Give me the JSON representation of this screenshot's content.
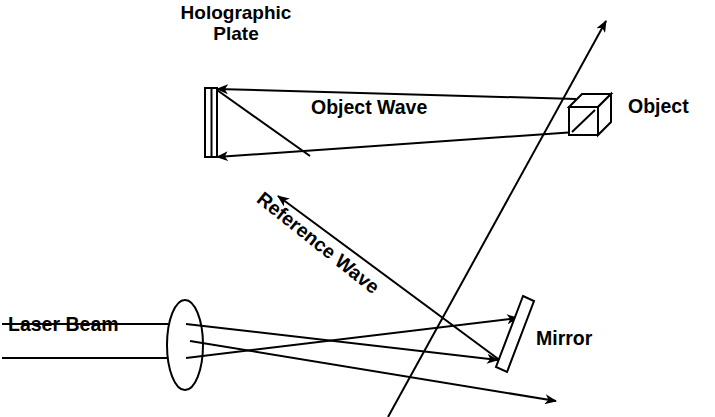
{
  "figure": {
    "background_color": "#ffffff",
    "ink_color": "#000000",
    "width": 715,
    "height": 417
  },
  "labels": {
    "holographic_plate_line1": "Holographic",
    "holographic_plate_line2": "Plate",
    "object_wave": "Object Wave",
    "object": "Object",
    "reference_wave": "Reference Wave",
    "laser_beam": "Laser Beam",
    "mirror": "Mirror"
  },
  "components": {
    "holographic_plate": {
      "name": "holographic-plate",
      "shape": "vertical-slab",
      "x1": 205,
      "y1": 88,
      "x2": 217,
      "y2": 157
    },
    "lens": {
      "name": "lens",
      "shape": "ellipse",
      "cx": 185,
      "cy": 345,
      "rx": 18,
      "ry": 45
    },
    "mirror": {
      "name": "mirror",
      "shape": "tilted-slab",
      "top_x": 528,
      "top_y": 300,
      "bottom_x": 500,
      "bottom_y": 370,
      "thickness": 11
    },
    "object_cube": {
      "name": "object-cube",
      "shape": "wireframe-cube",
      "front_x": 568,
      "front_y": 106,
      "size": 30,
      "depth": 13
    }
  },
  "rays": [
    {
      "name": "object-wave-upper",
      "from": "object",
      "to": "plate",
      "arrow": "left"
    },
    {
      "name": "object-wave-lower",
      "from": "object",
      "to": "plate",
      "arrow": "left"
    },
    {
      "name": "plate-diagonal",
      "from": "plate-top",
      "to": "plate-lower-ray",
      "arrow": "none"
    },
    {
      "name": "reference-wave-to-plate",
      "from": "mirror",
      "to": "plate",
      "arrow": "up-left"
    },
    {
      "name": "laser-upper-input",
      "from": "laser",
      "to": "lens",
      "arrow": "none"
    },
    {
      "name": "laser-lower-input",
      "from": "laser",
      "to": "lens",
      "arrow": "none"
    },
    {
      "name": "lens-to-mirror-upper",
      "from": "lens",
      "to": "mirror-top",
      "arrow": "right"
    },
    {
      "name": "lens-to-mirror-lower",
      "from": "lens",
      "to": "mirror-bottom",
      "arrow": "right"
    },
    {
      "name": "reflected-beam-up-right",
      "from": "plate",
      "to": "upper-right",
      "arrow": "up-right"
    },
    {
      "name": "reflected-beam-down-right",
      "from": "lens",
      "to": "lower-right",
      "arrow": "down-right"
    }
  ]
}
